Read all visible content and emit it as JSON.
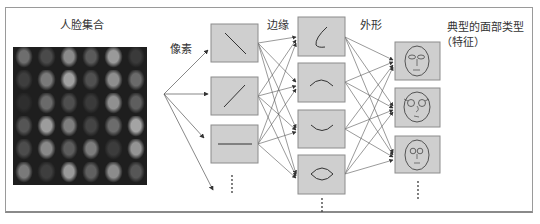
{
  "labels": {
    "face_set": "人脸集合",
    "pixels": "像素",
    "edges": "边缘",
    "shapes": "外形",
    "typical_faces_line1": "典型的面部类型",
    "typical_faces_line2": "（特征）"
  },
  "colors": {
    "box_fill": "#cfcfcf",
    "box_stroke": "#8c8c8c",
    "line": "#444444",
    "frame": "#9a9a9a"
  },
  "face_grid": {
    "rows": 6,
    "cols": 6,
    "tones": [
      "#6e6e6e",
      "#4a4a4a",
      "#8a8a8a",
      "#5a5a5a",
      "#9a9a9a",
      "#3a3a3a",
      "#3e3e3e",
      "#7a7a7a",
      "#a0a0a0",
      "#505050",
      "#8e8e8e",
      "#6a6a6a",
      "#2e2e2e",
      "#6a6a6a",
      "#4e4e4e",
      "#3a3a3a",
      "#909090",
      "#5e5e5e",
      "#555555",
      "#9c9c9c",
      "#7e7e7e",
      "#444444",
      "#6c6c6c",
      "#a4a4a4",
      "#4c4c4c",
      "#888888",
      "#5c5c5c",
      "#7c7c7c",
      "#3c3c3c",
      "#949494",
      "#7a7a7a",
      "#3e3e3e",
      "#9a9a9a",
      "#606060",
      "#8c8c8c",
      "#565656"
    ]
  },
  "layers": {
    "pixel_layer": {
      "name": "pixels",
      "fan_outputs": 4
    },
    "edge_layer": {
      "boxes": [
        "diagonal-down-line",
        "diagonal-up-line",
        "horizontal-line"
      ],
      "continuation": "⋮"
    },
    "shape_layer": {
      "boxes": [
        "corner-curve",
        "arc-up",
        "arc-down",
        "eye-shape"
      ],
      "continuation": "⋮"
    },
    "face_layer": {
      "boxes": [
        "face-oval-eyes",
        "face-glasses",
        "face-round-eyes"
      ],
      "continuation": "⋮"
    }
  }
}
